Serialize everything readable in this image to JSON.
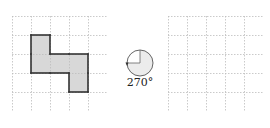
{
  "grids": {
    "rows": 5,
    "cols": 5,
    "cell_size": 19,
    "grid_line_color": "#bdbdbd",
    "left": {
      "shaded_cells": [
        [
          1,
          1
        ],
        [
          1,
          2
        ],
        [
          2,
          2
        ],
        [
          3,
          2
        ],
        [
          3,
          3
        ]
      ],
      "shape_fill": "#d8d8d8",
      "shape_stroke": "#333333"
    },
    "right": {
      "shaded_cells": []
    }
  },
  "rotation": {
    "angle_label": "270°",
    "direction": "clockwise",
    "icon": "rotation-270-icon"
  }
}
